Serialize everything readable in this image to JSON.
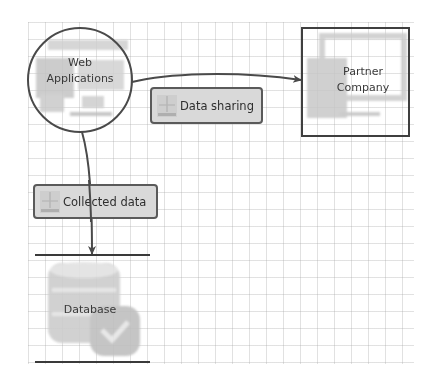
{
  "diagram": {
    "type": "data-flow-diagram",
    "grid": {
      "visible": true,
      "spacing_px": 17
    },
    "nodes": {
      "process": {
        "id": "web-applications",
        "shape": "circle",
        "label_line1": "Web",
        "label_line2": "Applications",
        "icon": "web-application-icon"
      },
      "external_entity": {
        "id": "partner-company",
        "shape": "rectangle",
        "label_line1": "Partner",
        "label_line2": "Company",
        "icon": "monitor-icon"
      },
      "data_store": {
        "id": "database",
        "shape": "open-parallel-lines",
        "label": "Database",
        "icon": "database-check-icon"
      }
    },
    "flows": [
      {
        "id": "data-sharing",
        "from": "web-applications",
        "to": "partner-company",
        "label": "Data sharing",
        "icon": "data-flow-icon"
      },
      {
        "id": "collected-data",
        "from": "web-applications",
        "to": "database",
        "label": "Collected data",
        "icon": "data-flow-icon"
      }
    ],
    "colors": {
      "stroke": "#4a4a4a",
      "label_fill": "#d9d9d9",
      "icon_gray": "#c8c8c8",
      "grid": "#dcdcdc",
      "text": "#3a3a3a"
    }
  }
}
